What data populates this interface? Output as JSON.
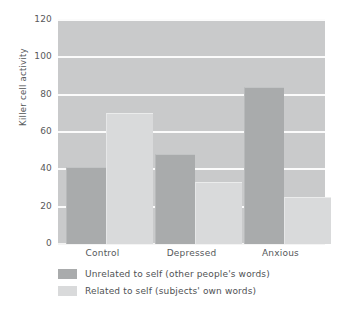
{
  "chart_data": {
    "type": "bar",
    "title": "",
    "xlabel": "",
    "ylabel": "Killer cell activity",
    "categories": [
      "Control",
      "Depressed",
      "Anxious"
    ],
    "series": [
      {
        "name": "Unrelated to self (other people's words)",
        "color": "#a9abac",
        "values": [
          41,
          48,
          84
        ]
      },
      {
        "name": "Related to self (subjects' own words)",
        "color": "#d9dadb",
        "values": [
          70,
          33,
          25
        ]
      }
    ],
    "ylim": [
      0,
      120
    ],
    "yticks": [
      0,
      20,
      40,
      60,
      80,
      100,
      120
    ],
    "ytick_labels": [
      "0",
      "20",
      "40",
      "60",
      "80",
      "100",
      "120"
    ],
    "grid": true,
    "grid_color": "#fbfbfb",
    "plot_background": "#c9cacb",
    "legend_position": "below-left"
  }
}
